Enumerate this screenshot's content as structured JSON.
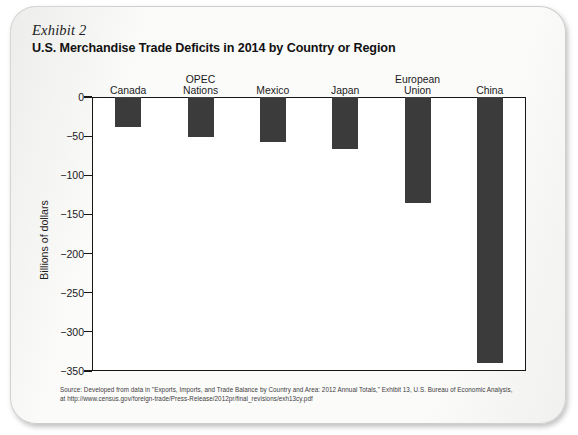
{
  "card": {
    "exhibit_label": "Exhibit 2",
    "title": "U.S. Merchandise Trade Deficits in 2014 by Country or Region"
  },
  "source": {
    "line1": "Source: Developed from data in \"Exports, Imports, and Trade Balance by Country and Area: 2012 Annual Totals,\" Exhibit 13, U.S. Bureau of Economic Analysis,",
    "line2": "at http://www.census.gov/foreign-trade/Press-Release/2012pr/final_revisions/exh13cy.pdf"
  },
  "colors": {
    "bar": "#3b3b3b",
    "axis": "#161616",
    "plot_background": "#ffffff",
    "page": "#fbfbfa"
  },
  "chart_data": {
    "type": "bar",
    "title": "U.S. Merchandise Trade Deficits in 2014 by Country or Region",
    "xlabel": "",
    "ylabel": "Billions of dollars",
    "ylim": [
      -350,
      0
    ],
    "grid": false,
    "legend": "none",
    "orientation": "vertical",
    "categories": [
      "Canada",
      "OPEC Nations",
      "Mexico",
      "Japan",
      "European Union",
      "China"
    ],
    "category_lines": [
      [
        "Canada"
      ],
      [
        "OPEC",
        "Nations"
      ],
      [
        "Mexico"
      ],
      [
        "Japan"
      ],
      [
        "European",
        "Union"
      ],
      [
        "China"
      ]
    ],
    "values": [
      -38,
      -51,
      -58,
      -67,
      -136,
      -340
    ],
    "ytick_labels": [
      "0",
      "−50",
      "−100",
      "−150",
      "−200",
      "−250",
      "−300",
      "−350"
    ],
    "ytick_values": [
      0,
      -50,
      -100,
      -150,
      -200,
      -250,
      -300,
      -350
    ]
  }
}
